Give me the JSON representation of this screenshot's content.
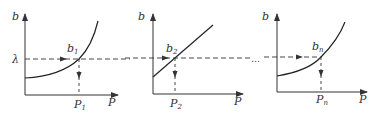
{
  "diagram": {
    "lambda_label": "λ",
    "ellipsis": "…",
    "panels": [
      {
        "y_axis": "b",
        "x_axis": "P",
        "point": "b",
        "point_sub": "1",
        "p": "P",
        "p_sub": "1",
        "curve": "convex"
      },
      {
        "y_axis": "b",
        "x_axis": "P",
        "point": "b",
        "point_sub": "2",
        "p": "P",
        "p_sub": "2",
        "curve": "linear"
      },
      {
        "y_axis": "b",
        "x_axis": "P",
        "point": "b",
        "point_sub": "n",
        "p": "P",
        "p_sub": "n",
        "curve": "convex"
      }
    ],
    "colors": {
      "stroke": "#333333",
      "background": "#ffffff"
    }
  }
}
